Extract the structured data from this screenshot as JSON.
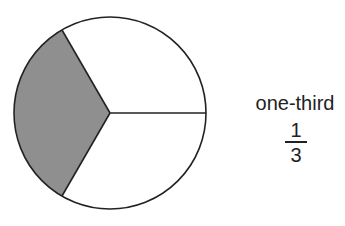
{
  "diagram": {
    "type": "fraction-circle",
    "total_parts": 3,
    "shaded_parts": 1,
    "shade_color": "#8f8f8f",
    "outline_color": "#222222"
  },
  "caption": {
    "word": "one-third",
    "numerator": "1",
    "denominator": "3"
  }
}
